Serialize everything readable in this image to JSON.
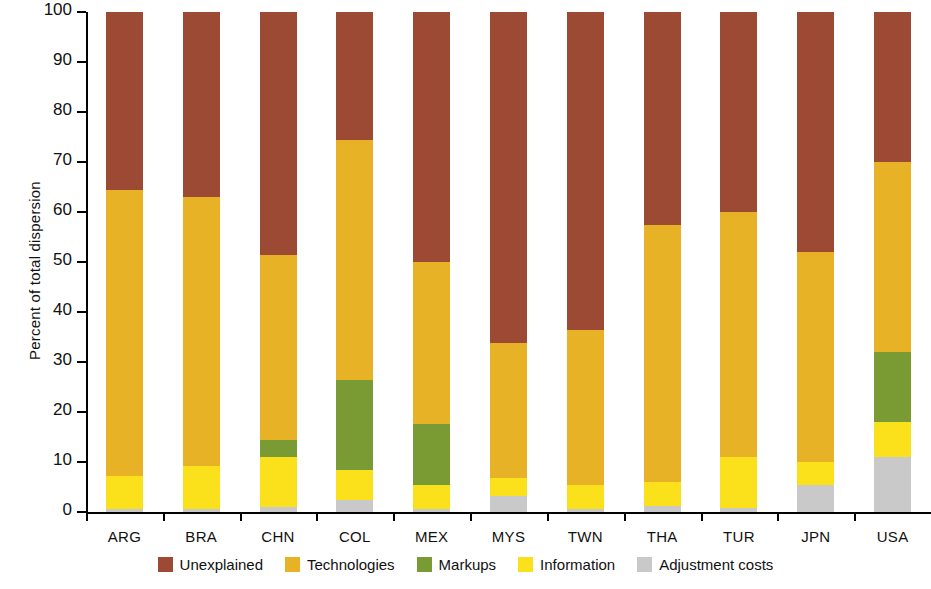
{
  "chart_data": {
    "type": "bar",
    "stacked": true,
    "title": "",
    "subtitle": "",
    "xlabel": "",
    "ylabel": "Percent of total dispersion",
    "ylim": [
      0,
      100
    ],
    "ytick_labels": [
      "0",
      "10",
      "20",
      "30",
      "40",
      "50",
      "60",
      "70",
      "80",
      "90",
      "100"
    ],
    "ytick_values": [
      0,
      10,
      20,
      30,
      40,
      50,
      60,
      70,
      80,
      90,
      100
    ],
    "grid": false,
    "legend_position": "bottom",
    "categories": [
      "ARG",
      "BRA",
      "CHN",
      "COL",
      "MEX",
      "MYS",
      "TWN",
      "THA",
      "TUR",
      "JPN",
      "USA"
    ],
    "series": [
      {
        "name": "Adjustment costs",
        "color": "#c9c9c9",
        "values": [
          0.7,
          0.7,
          1.0,
          2.5,
          0.7,
          3.2,
          0.6,
          1.2,
          0.8,
          5.5,
          11.0
        ]
      },
      {
        "name": "Information",
        "color": "#fbe01c",
        "values": [
          6.6,
          8.6,
          10.1,
          6.0,
          4.8,
          3.6,
          4.9,
          4.8,
          10.3,
          4.5,
          7.0
        ]
      },
      {
        "name": "Markups",
        "color": "#7a9a33",
        "values": [
          0.0,
          0.0,
          3.4,
          18.0,
          12.2,
          0.0,
          0.0,
          0.0,
          0.0,
          0.0,
          14.0
        ]
      },
      {
        "name": "Technologies",
        "color": "#e8b227",
        "values": [
          57.1,
          53.7,
          37.0,
          48.0,
          32.3,
          27.0,
          30.9,
          51.5,
          48.9,
          42.0,
          38.0
        ]
      },
      {
        "name": "Unexplained",
        "color": "#9c4a33",
        "values": [
          35.6,
          37.0,
          48.5,
          25.5,
          50.0,
          66.2,
          63.6,
          42.5,
          40.0,
          48.0,
          30.0
        ]
      }
    ],
    "cumulative_tops": {
      "ARG": [
        0.7,
        7.3,
        7.3,
        64.4,
        100
      ],
      "BRA": [
        0.7,
        9.3,
        9.3,
        63.0,
        100
      ],
      "CHN": [
        1.0,
        11.1,
        14.5,
        51.5,
        100
      ],
      "COL": [
        2.5,
        8.5,
        26.5,
        74.5,
        100
      ],
      "MEX": [
        0.7,
        5.5,
        17.7,
        50.0,
        100
      ],
      "MYS": [
        3.2,
        6.8,
        6.8,
        33.8,
        100
      ],
      "TWN": [
        0.6,
        5.5,
        5.5,
        36.4,
        100
      ],
      "THA": [
        1.2,
        6.0,
        6.0,
        57.5,
        100
      ],
      "TUR": [
        0.8,
        11.1,
        11.1,
        60.0,
        100
      ],
      "JPN": [
        5.5,
        10.0,
        10.0,
        52.0,
        100
      ],
      "USA": [
        11.0,
        18.0,
        32.0,
        70.0,
        100
      ]
    }
  },
  "legend": {
    "items": [
      {
        "label": "Unexplained",
        "color": "#9c4a33"
      },
      {
        "label": "Technologies",
        "color": "#e8b227"
      },
      {
        "label": "Markups",
        "color": "#7a9a33"
      },
      {
        "label": "Information",
        "color": "#fbe01c"
      },
      {
        "label": "Adjustment costs",
        "color": "#c9c9c9"
      }
    ]
  }
}
